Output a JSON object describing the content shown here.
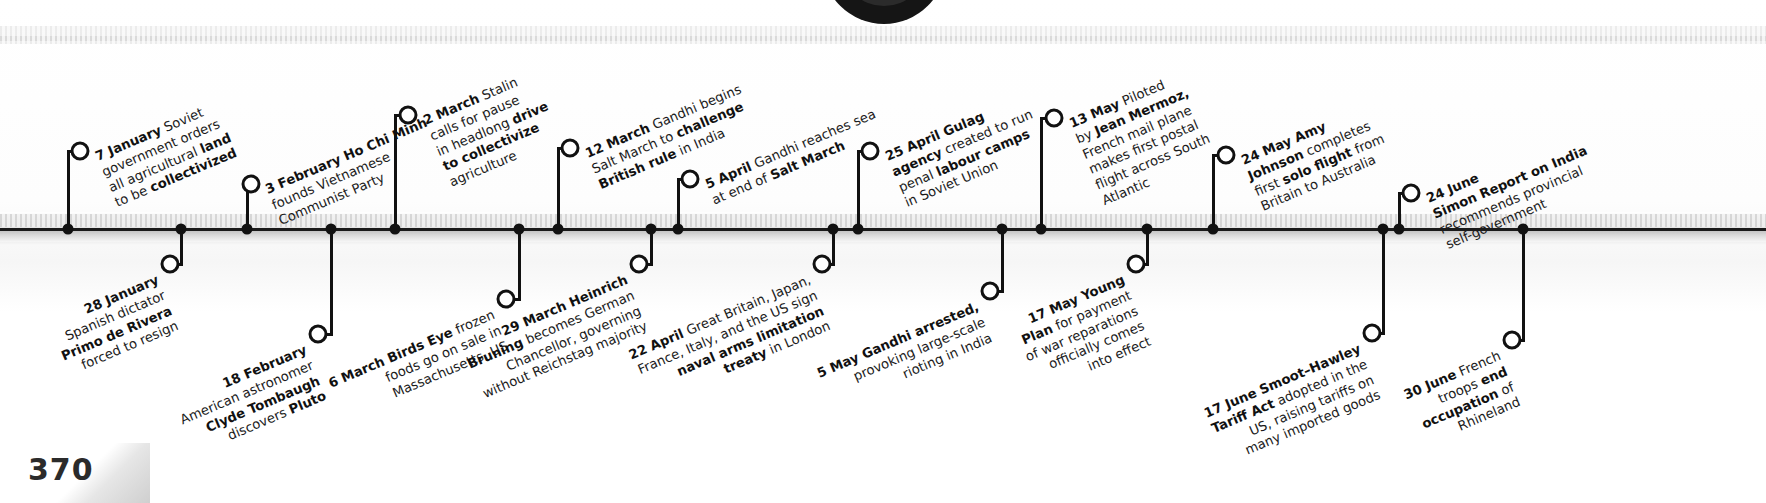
{
  "page": {
    "number": "370",
    "year_context": "1930"
  },
  "timeline": {
    "orientation": "horizontal",
    "rotation_deg": -23,
    "events": [
      {
        "id": "7-january",
        "date": "7 January",
        "side": "above",
        "lines": [
          [
            {
              "t": "7 January",
              "b": true
            },
            {
              "t": " Soviet",
              "b": false
            }
          ],
          [
            {
              "t": "government orders",
              "b": false
            }
          ],
          [
            {
              "t": "all agricultural ",
              "b": false
            },
            {
              "t": "land",
              "b": true
            }
          ],
          [
            {
              "t": "to be ",
              "b": false
            },
            {
              "t": "collectivized",
              "b": true
            }
          ]
        ]
      },
      {
        "id": "28-january",
        "date": "28 January",
        "side": "below",
        "lines": [
          [
            {
              "t": "28 January",
              "b": true
            }
          ],
          [
            {
              "t": "Spanish dictator",
              "b": false
            }
          ],
          [
            {
              "t": "Primo de Rivera",
              "b": true
            }
          ],
          [
            {
              "t": "forced to resign",
              "b": false
            }
          ]
        ]
      },
      {
        "id": "3-february",
        "date": "3 February",
        "side": "above",
        "lines": [
          [
            {
              "t": "3 February",
              "b": true
            },
            {
              "t": " Ho Chi Minh",
              "b": true
            }
          ],
          [
            {
              "t": "founds Vietnamese",
              "b": false
            }
          ],
          [
            {
              "t": "Communist Party",
              "b": false
            }
          ]
        ]
      },
      {
        "id": "18-february",
        "date": "18 February",
        "side": "below",
        "lines": [
          [
            {
              "t": "18 February",
              "b": true
            }
          ],
          [
            {
              "t": "American astronomer",
              "b": false
            }
          ],
          [
            {
              "t": "Clyde Tombaugh",
              "b": true
            }
          ],
          [
            {
              "t": "discovers ",
              "b": false
            },
            {
              "t": "Pluto",
              "b": true
            }
          ]
        ]
      },
      {
        "id": "2-march",
        "date": "2 March",
        "side": "above",
        "lines": [
          [
            {
              "t": "2 March",
              "b": true
            },
            {
              "t": " Stalin",
              "b": false
            }
          ],
          [
            {
              "t": "calls for pause",
              "b": false
            }
          ],
          [
            {
              "t": "in headlong ",
              "b": false
            },
            {
              "t": "drive",
              "b": true
            }
          ],
          [
            {
              "t": "to collectivize",
              "b": true
            }
          ],
          [
            {
              "t": "agriculture",
              "b": false
            }
          ]
        ]
      },
      {
        "id": "6-march",
        "date": "6 March",
        "side": "below",
        "lines": [
          [
            {
              "t": "6 March Birds Eye",
              "b": true
            },
            {
              "t": " frozen",
              "b": false
            }
          ],
          [
            {
              "t": "foods go on sale in",
              "b": false
            }
          ],
          [
            {
              "t": "Massachusetts, US",
              "b": false
            }
          ]
        ]
      },
      {
        "id": "12-march",
        "date": "12 March",
        "side": "above",
        "lines": [
          [
            {
              "t": "12 March",
              "b": true
            },
            {
              "t": " Gandhi begins",
              "b": false
            }
          ],
          [
            {
              "t": "Salt March to ",
              "b": false
            },
            {
              "t": "challenge",
              "b": true
            }
          ],
          [
            {
              "t": "British rule",
              "b": true
            },
            {
              "t": " in India",
              "b": false
            }
          ]
        ]
      },
      {
        "id": "29-march",
        "date": "29 March",
        "side": "below",
        "lines": [
          [
            {
              "t": "29 March Heinrich",
              "b": true
            }
          ],
          [
            {
              "t": "Bruning",
              "b": true
            },
            {
              "t": " becomes German",
              "b": false
            }
          ],
          [
            {
              "t": "Chancellor, governing",
              "b": false
            }
          ],
          [
            {
              "t": "without Reichstag majority",
              "b": false
            }
          ]
        ]
      },
      {
        "id": "5-april",
        "date": "5 April",
        "side": "above",
        "lines": [
          [
            {
              "t": "5 April",
              "b": true
            },
            {
              "t": " Gandhi reaches sea",
              "b": false
            }
          ],
          [
            {
              "t": "at end of ",
              "b": false
            },
            {
              "t": "Salt March",
              "b": true
            }
          ]
        ]
      },
      {
        "id": "22-april",
        "date": "22 April",
        "side": "below",
        "lines": [
          [
            {
              "t": "22 April",
              "b": true
            },
            {
              "t": " Great Britain, Japan,",
              "b": false
            }
          ],
          [
            {
              "t": "France, Italy, and the US sign",
              "b": false
            }
          ],
          [
            {
              "t": "naval arms limitation",
              "b": true
            }
          ],
          [
            {
              "t": "treaty",
              "b": true
            },
            {
              "t": " in London",
              "b": false
            }
          ]
        ]
      },
      {
        "id": "25-april",
        "date": "25 April",
        "side": "above",
        "lines": [
          [
            {
              "t": "25 April Gulag",
              "b": true
            }
          ],
          [
            {
              "t": "agency",
              "b": true
            },
            {
              "t": " created to run",
              "b": false
            }
          ],
          [
            {
              "t": "penal ",
              "b": false
            },
            {
              "t": "labour camps",
              "b": true
            }
          ],
          [
            {
              "t": "in Soviet Union",
              "b": false
            }
          ]
        ]
      },
      {
        "id": "5-may",
        "date": "5 May",
        "side": "below",
        "lines": [
          [
            {
              "t": "5 May Gandhi arrested,",
              "b": true
            }
          ],
          [
            {
              "t": "provoking large-scale",
              "b": false
            }
          ],
          [
            {
              "t": "rioting in India",
              "b": false
            }
          ]
        ]
      },
      {
        "id": "13-may",
        "date": "13 May",
        "side": "above",
        "lines": [
          [
            {
              "t": "13 May",
              "b": true
            },
            {
              "t": " Piloted",
              "b": false
            }
          ],
          [
            {
              "t": "by ",
              "b": false
            },
            {
              "t": "Jean Mermoz,",
              "b": true
            }
          ],
          [
            {
              "t": "French mail plane",
              "b": false
            }
          ],
          [
            {
              "t": "makes first postal",
              "b": false
            }
          ],
          [
            {
              "t": "flight across South",
              "b": false
            }
          ],
          [
            {
              "t": "Atlantic",
              "b": false
            }
          ]
        ]
      },
      {
        "id": "17-may",
        "date": "17 May",
        "side": "below",
        "lines": [
          [
            {
              "t": "17 May Young",
              "b": true
            }
          ],
          [
            {
              "t": "Plan",
              "b": true
            },
            {
              "t": " for payment",
              "b": false
            }
          ],
          [
            {
              "t": "of war reparations",
              "b": false
            }
          ],
          [
            {
              "t": "officially comes",
              "b": false
            }
          ],
          [
            {
              "t": "into effect",
              "b": false
            }
          ]
        ]
      },
      {
        "id": "24-may",
        "date": "24 May",
        "side": "above",
        "lines": [
          [
            {
              "t": "24 May Amy",
              "b": true
            }
          ],
          [
            {
              "t": "Johnson",
              "b": true
            },
            {
              "t": " completes",
              "b": false
            }
          ],
          [
            {
              "t": "first ",
              "b": false
            },
            {
              "t": "solo flight",
              "b": true
            },
            {
              "t": " from",
              "b": false
            }
          ],
          [
            {
              "t": "Britain to Australia",
              "b": false
            }
          ]
        ]
      },
      {
        "id": "17-june",
        "date": "17 June",
        "side": "below",
        "lines": [
          [
            {
              "t": "17 June Smoot–Hawley",
              "b": true
            }
          ],
          [
            {
              "t": "Tariff Act",
              "b": true
            },
            {
              "t": " adopted in the",
              "b": false
            }
          ],
          [
            {
              "t": "US, raising tariffs on",
              "b": false
            }
          ],
          [
            {
              "t": "many imported goods",
              "b": false
            }
          ]
        ]
      },
      {
        "id": "24-june",
        "date": "24 June",
        "side": "above",
        "lines": [
          [
            {
              "t": "24 June",
              "b": true
            }
          ],
          [
            {
              "t": "Simon Report on India",
              "b": true
            }
          ],
          [
            {
              "t": "recommends provincial",
              "b": false
            }
          ],
          [
            {
              "t": "self-government",
              "b": false
            }
          ]
        ]
      },
      {
        "id": "30-june",
        "date": "30 June",
        "side": "below",
        "lines": [
          [
            {
              "t": "30 June",
              "b": true
            },
            {
              "t": " French",
              "b": false
            }
          ],
          [
            {
              "t": "troops ",
              "b": false
            },
            {
              "t": "end",
              "b": true
            }
          ],
          [
            {
              "t": "occupation",
              "b": true
            },
            {
              "t": " of",
              "b": false
            }
          ],
          [
            {
              "t": "Rhineland",
              "b": false
            }
          ]
        ]
      }
    ]
  },
  "geometry": {
    "axis_y": 229,
    "markers": [
      {
        "id": "7-january",
        "dot_x": 68,
        "ring_x": 80,
        "ring_y": 151,
        "stem_x": 68,
        "elbow": true
      },
      {
        "id": "28-january",
        "dot_x": 181,
        "ring_x": 170,
        "ring_y": 264,
        "stem_x": 181,
        "elbow": true
      },
      {
        "id": "3-february",
        "dot_x": 247,
        "ring_x": 251,
        "ring_y": 184,
        "stem_x": 247,
        "elbow": true
      },
      {
        "id": "18-february",
        "dot_x": 331,
        "ring_x": 318,
        "ring_y": 334,
        "stem_x": 331,
        "elbow": true
      },
      {
        "id": "2-march",
        "dot_x": 395,
        "ring_x": 408,
        "ring_y": 115,
        "stem_x": 395,
        "elbow": true
      },
      {
        "id": "6-march",
        "dot_x": 519,
        "ring_x": 506,
        "ring_y": 299,
        "stem_x": 519,
        "elbow": true
      },
      {
        "id": "12-march",
        "dot_x": 558,
        "ring_x": 570,
        "ring_y": 148,
        "stem_x": 558,
        "elbow": true
      },
      {
        "id": "29-march",
        "dot_x": 651,
        "ring_x": 639,
        "ring_y": 264,
        "stem_x": 651,
        "elbow": true
      },
      {
        "id": "5-april",
        "dot_x": 678,
        "ring_x": 690,
        "ring_y": 179,
        "stem_x": 678,
        "elbow": true
      },
      {
        "id": "22-april",
        "dot_x": 833,
        "ring_x": 822,
        "ring_y": 264,
        "stem_x": 833,
        "elbow": true
      },
      {
        "id": "25-april",
        "dot_x": 858,
        "ring_x": 870,
        "ring_y": 151,
        "stem_x": 858,
        "elbow": true
      },
      {
        "id": "5-may",
        "dot_x": 1002,
        "ring_x": 990,
        "ring_y": 291,
        "stem_x": 1002,
        "elbow": true
      },
      {
        "id": "13-may",
        "dot_x": 1041,
        "ring_x": 1054,
        "ring_y": 118,
        "stem_x": 1041,
        "elbow": true
      },
      {
        "id": "17-may",
        "dot_x": 1147,
        "ring_x": 1136,
        "ring_y": 264,
        "stem_x": 1147,
        "elbow": true
      },
      {
        "id": "24-may",
        "dot_x": 1213,
        "ring_x": 1226,
        "ring_y": 155,
        "stem_x": 1213,
        "elbow": true
      },
      {
        "id": "17-june",
        "dot_x": 1383,
        "ring_x": 1372,
        "ring_y": 333,
        "stem_x": 1383,
        "elbow": true
      },
      {
        "id": "24-june",
        "dot_x": 1399,
        "ring_x": 1411,
        "ring_y": 193,
        "stem_x": 1399,
        "elbow": true
      },
      {
        "id": "30-june",
        "dot_x": 1523,
        "ring_x": 1512,
        "ring_y": 340,
        "stem_x": 1523,
        "elbow": true
      }
    ],
    "labels": [
      {
        "id": "7-january",
        "x": 93,
        "y": 150,
        "anchor": "left"
      },
      {
        "id": "28-january",
        "x": 155,
        "y": 272,
        "anchor": "right"
      },
      {
        "id": "3-february",
        "x": 263,
        "y": 183,
        "anchor": "left"
      },
      {
        "id": "18-february",
        "x": 303,
        "y": 342,
        "anchor": "right"
      },
      {
        "id": "2-march",
        "x": 421,
        "y": 114,
        "anchor": "left"
      },
      {
        "id": "6-march",
        "x": 491,
        "y": 307,
        "anchor": "right"
      },
      {
        "id": "12-march",
        "x": 583,
        "y": 147,
        "anchor": "left"
      },
      {
        "id": "29-march",
        "x": 624,
        "y": 272,
        "anchor": "right"
      },
      {
        "id": "5-april",
        "x": 703,
        "y": 178,
        "anchor": "left"
      },
      {
        "id": "22-april",
        "x": 807,
        "y": 272,
        "anchor": "right"
      },
      {
        "id": "25-april",
        "x": 883,
        "y": 150,
        "anchor": "left"
      },
      {
        "id": "5-may",
        "x": 975,
        "y": 299,
        "anchor": "right"
      },
      {
        "id": "13-may",
        "x": 1067,
        "y": 117,
        "anchor": "left"
      },
      {
        "id": "17-may",
        "x": 1121,
        "y": 272,
        "anchor": "right"
      },
      {
        "id": "24-may",
        "x": 1239,
        "y": 154,
        "anchor": "left"
      },
      {
        "id": "17-june",
        "x": 1357,
        "y": 341,
        "anchor": "right"
      },
      {
        "id": "24-june",
        "x": 1424,
        "y": 192,
        "anchor": "left"
      },
      {
        "id": "30-june",
        "x": 1497,
        "y": 348,
        "anchor": "right"
      }
    ]
  }
}
